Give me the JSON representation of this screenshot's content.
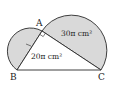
{
  "diagram": {
    "points": {
      "A": {
        "label": "A",
        "x": 42,
        "y": 31
      },
      "B": {
        "label": "B",
        "x": 17,
        "y": 70
      },
      "C": {
        "label": "C",
        "x": 101,
        "y": 70
      }
    },
    "regions": {
      "large_semicircle_area": "30π cm²",
      "small_region_area": "20π cm²"
    },
    "right_angle_at": "A",
    "colors": {
      "shade": "#d9d9d9",
      "line": "#2a2a2a",
      "background": "#ffffff"
    }
  }
}
